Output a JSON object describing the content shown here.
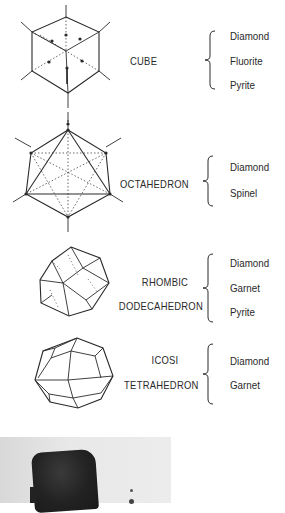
{
  "page_marker": "4)",
  "crystal_forms": [
    {
      "name_lines": [
        "CUBE"
      ],
      "minerals": [
        "Diamond",
        "Fluorite",
        "Pyrite"
      ]
    },
    {
      "name_lines": [
        "OCTAHEDRON"
      ],
      "minerals": [
        "Diamond",
        "Spinel"
      ]
    },
    {
      "name_lines": [
        "RHOMBIC",
        "DODECAHEDRON"
      ],
      "minerals": [
        "Diamond",
        "Garnet",
        "Pyrite"
      ]
    },
    {
      "name_lines": [
        "ICOSI",
        "TETRAHEDRON"
      ],
      "minerals": [
        "Diamond",
        "Garnet"
      ]
    }
  ],
  "photo": {
    "description": "black-and-white photograph of a dark cubic crystal"
  },
  "colors": {
    "ink": "#2a2a2a",
    "background": "#ffffff",
    "photo_bg": "#e4e4e4",
    "crystal": "#222222"
  }
}
